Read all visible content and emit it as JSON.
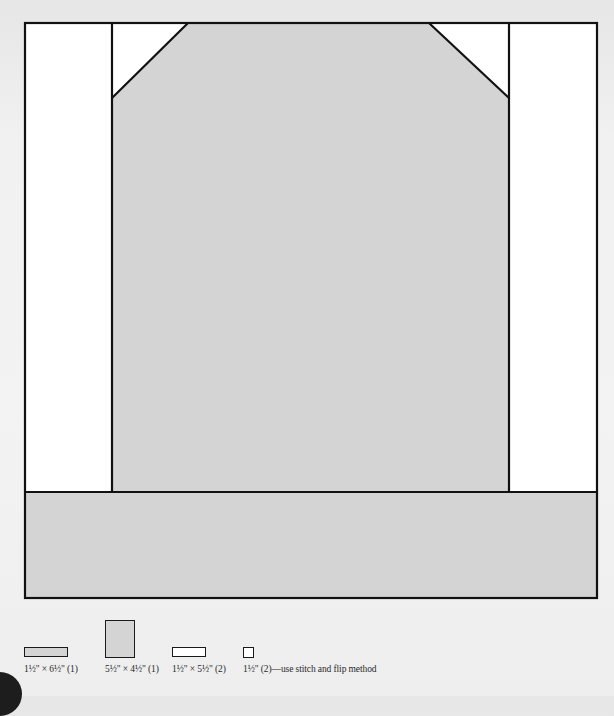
{
  "colors": {
    "gray_fill": "#d4d4d4",
    "white_fill": "#ffffff",
    "outline": "#111111"
  },
  "diagram": {
    "outer": {
      "x": 25,
      "y": 22,
      "w": 572,
      "h": 576
    },
    "pieces": [
      {
        "name": "left-side-strip",
        "fill": "white"
      },
      {
        "name": "right-side-strip",
        "fill": "white"
      },
      {
        "name": "center-panel",
        "fill": "gray"
      },
      {
        "name": "top-left-corner-triangle",
        "fill": "white"
      },
      {
        "name": "top-right-corner-triangle",
        "fill": "white"
      },
      {
        "name": "bottom-strip",
        "fill": "gray"
      }
    ]
  },
  "legend": [
    {
      "label": "1½\" × 6½\" (1)",
      "fill": "gray"
    },
    {
      "label": "5½\" × 4½\" (1)",
      "fill": "gray"
    },
    {
      "label": "1½\" × 5½\" (2)",
      "fill": "white"
    },
    {
      "label": "1½\" (2)—use stitch and flip method",
      "fill": "white"
    }
  ]
}
